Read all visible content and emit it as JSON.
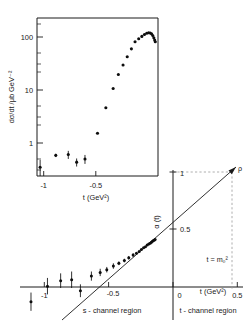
{
  "figure": {
    "name": "regge-trajectory-and-cross-section-figure"
  },
  "chart_data": [
    {
      "id": "cross_section_inset",
      "type": "scatter",
      "title": "",
      "xlabel": "t (GeV²)",
      "ylabel": "dσ/dt /μb  GeV⁻²",
      "xlim": [
        -1.18,
        -0.02
      ],
      "ylim": [
        0.2,
        300
      ],
      "yscale": "log",
      "xticks": [
        -1,
        -0.5
      ],
      "xticklabels": [
        "-1",
        "-0.5"
      ],
      "yticks": [
        1,
        10,
        100
      ],
      "yticklabels": [
        "1",
        "10",
        "100"
      ],
      "grid": false,
      "legend": null,
      "points": [
        {
          "x": -1.15,
          "y": 0.3,
          "yerr_lo": 0.12,
          "yerr_hi": 0.12
        },
        {
          "x": -1.0,
          "y": 0.52,
          "yerr_lo": 0.04,
          "yerr_hi": 0.04
        },
        {
          "x": -0.88,
          "y": 0.54,
          "yerr_lo": 0.1,
          "yerr_hi": 0.1
        },
        {
          "x": -0.8,
          "y": 0.38,
          "yerr_lo": 0.07,
          "yerr_hi": 0.07
        },
        {
          "x": -0.72,
          "y": 0.44,
          "yerr_lo": 0.09,
          "yerr_hi": 0.09
        },
        {
          "x": -0.6,
          "y": 1.45,
          "yerr_lo": 0.0,
          "yerr_hi": 0.0
        },
        {
          "x": -0.52,
          "y": 4.7,
          "yerr_lo": 0.0,
          "yerr_hi": 0.0
        },
        {
          "x": -0.45,
          "y": 11.5,
          "yerr_lo": 0.0,
          "yerr_hi": 0.0
        },
        {
          "x": -0.4,
          "y": 22.0,
          "yerr_lo": 0.0,
          "yerr_hi": 0.0
        },
        {
          "x": -0.355,
          "y": 34.0,
          "yerr_lo": 0.0,
          "yerr_hi": 0.0
        },
        {
          "x": -0.315,
          "y": 50.0,
          "yerr_lo": 0.0,
          "yerr_hi": 0.0
        },
        {
          "x": -0.275,
          "y": 72.0,
          "yerr_lo": 0.0,
          "yerr_hi": 0.0
        },
        {
          "x": -0.24,
          "y": 100.0,
          "yerr_lo": 0.0,
          "yerr_hi": 0.0
        },
        {
          "x": -0.205,
          "y": 115.0,
          "yerr_lo": 0.0,
          "yerr_hi": 0.0
        },
        {
          "x": -0.175,
          "y": 128.0,
          "yerr_lo": 0.0,
          "yerr_hi": 0.0
        },
        {
          "x": -0.15,
          "y": 140.0,
          "yerr_lo": 0.0,
          "yerr_hi": 0.0
        },
        {
          "x": -0.128,
          "y": 148.0,
          "yerr_lo": 0.0,
          "yerr_hi": 0.0
        },
        {
          "x": -0.11,
          "y": 152.0,
          "yerr_lo": 0.0,
          "yerr_hi": 0.0
        },
        {
          "x": -0.095,
          "y": 150.0,
          "yerr_lo": 0.0,
          "yerr_hi": 0.0
        },
        {
          "x": -0.082,
          "y": 144.0,
          "yerr_lo": 0.0,
          "yerr_hi": 0.0
        },
        {
          "x": -0.07,
          "y": 133.0,
          "yerr_lo": 0.0,
          "yerr_hi": 0.0
        },
        {
          "x": -0.06,
          "y": 120.0,
          "yerr_lo": 0.0,
          "yerr_hi": 0.0
        },
        {
          "x": -0.052,
          "y": 108.0,
          "yerr_lo": 0.0,
          "yerr_hi": 0.0
        },
        {
          "x": -0.046,
          "y": 100.0,
          "yerr_lo": 0.0,
          "yerr_hi": 0.0
        }
      ]
    },
    {
      "id": "regge_trajectory",
      "type": "scatter",
      "title": "",
      "xlabel": "t (GeV²)",
      "ylabel": "α (t)",
      "xlim": [
        -1.25,
        0.78
      ],
      "ylim": [
        -0.42,
        1.22
      ],
      "xticks": [
        -1,
        -0.5,
        0,
        0.5
      ],
      "xticklabels": [
        "-1",
        "-0.5",
        "0",
        "0.5"
      ],
      "yticks": [
        0.5,
        1
      ],
      "yticklabels": [
        "0.5",
        "1"
      ],
      "grid": false,
      "line": {
        "label": "linear Regge trajectory",
        "intercept": 0.47,
        "slope": 0.88
      },
      "annotations": [
        {
          "text": "ρ",
          "x": 0.6,
          "y": 1.0,
          "kind": "particle-pole-label"
        },
        {
          "text": "t = m₀²",
          "x": 0.6,
          "y": 0.34,
          "kind": "pole-position-label"
        },
        {
          "text": "s - channel region",
          "x": -0.52,
          "y": -0.34,
          "kind": "region-label"
        },
        {
          "text": "t - channel region",
          "x": 0.27,
          "y": -0.34,
          "kind": "region-label"
        }
      ],
      "points": [
        {
          "x": -1.15,
          "y": -0.22,
          "yerr_lo": 0.1,
          "yerr_hi": 0.1
        },
        {
          "x": -1.0,
          "y": -0.05,
          "yerr_lo": 0.09,
          "yerr_hi": 0.09
        },
        {
          "x": -0.88,
          "y": 0.01,
          "yerr_lo": 0.08,
          "yerr_hi": 0.08
        },
        {
          "x": -0.78,
          "y": 0.02,
          "yerr_lo": 0.09,
          "yerr_hi": 0.09
        },
        {
          "x": -0.7,
          "y": -0.1,
          "yerr_lo": 0.07,
          "yerr_hi": 0.07
        },
        {
          "x": -0.6,
          "y": 0.06,
          "yerr_lo": 0.05,
          "yerr_hi": 0.05
        },
        {
          "x": -0.52,
          "y": 0.1,
          "yerr_lo": 0.04,
          "yerr_hi": 0.04
        },
        {
          "x": -0.46,
          "y": 0.13,
          "yerr_lo": 0.03,
          "yerr_hi": 0.03
        },
        {
          "x": -0.4,
          "y": 0.17,
          "yerr_lo": 0.03,
          "yerr_hi": 0.03
        },
        {
          "x": -0.35,
          "y": 0.2,
          "yerr_lo": 0.02,
          "yerr_hi": 0.02
        },
        {
          "x": -0.3,
          "y": 0.23,
          "yerr_lo": 0.02,
          "yerr_hi": 0.02
        },
        {
          "x": -0.26,
          "y": 0.26,
          "yerr_lo": 0.02,
          "yerr_hi": 0.02
        },
        {
          "x": -0.22,
          "y": 0.29,
          "yerr_lo": 0.02,
          "yerr_hi": 0.02
        },
        {
          "x": -0.19,
          "y": 0.31,
          "yerr_lo": 0.0,
          "yerr_hi": 0.0
        },
        {
          "x": -0.165,
          "y": 0.33,
          "yerr_lo": 0.0,
          "yerr_hi": 0.0
        },
        {
          "x": -0.145,
          "y": 0.35,
          "yerr_lo": 0.0,
          "yerr_hi": 0.0
        },
        {
          "x": -0.125,
          "y": 0.37,
          "yerr_lo": 0.0,
          "yerr_hi": 0.0
        },
        {
          "x": -0.108,
          "y": 0.38,
          "yerr_lo": 0.0,
          "yerr_hi": 0.0
        },
        {
          "x": -0.092,
          "y": 0.4,
          "yerr_lo": 0.0,
          "yerr_hi": 0.0
        },
        {
          "x": -0.078,
          "y": 0.41,
          "yerr_lo": 0.0,
          "yerr_hi": 0.0
        },
        {
          "x": -0.065,
          "y": 0.42,
          "yerr_lo": 0.0,
          "yerr_hi": 0.0
        },
        {
          "x": -0.054,
          "y": 0.43,
          "yerr_lo": 0.0,
          "yerr_hi": 0.0
        },
        {
          "x": -0.044,
          "y": 0.44,
          "yerr_lo": 0.0,
          "yerr_hi": 0.0
        },
        {
          "x": -0.035,
          "y": 0.45,
          "yerr_lo": 0.0,
          "yerr_hi": 0.0
        },
        {
          "x": -0.027,
          "y": 0.455,
          "yerr_lo": 0.0,
          "yerr_hi": 0.0
        },
        {
          "x": -0.02,
          "y": 0.46,
          "yerr_lo": 0.0,
          "yerr_hi": 0.0
        }
      ]
    }
  ]
}
